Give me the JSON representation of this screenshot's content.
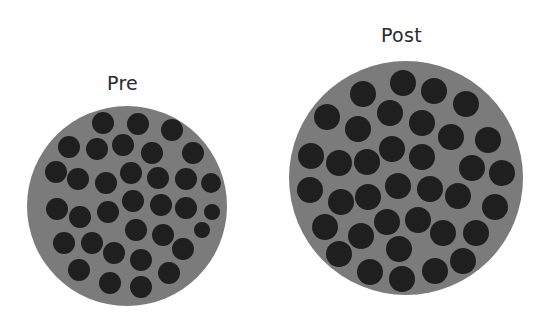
{
  "colors": {
    "disc": "#7b7b7b",
    "dot": "#1f1f1f",
    "background": "#ffffff"
  },
  "panels": [
    {
      "label": "Pre",
      "label_pos": [
        107,
        72
      ],
      "disc": {
        "cx": 127,
        "cy": 206,
        "r": 100
      },
      "dots": [
        [
          103,
          123,
          11
        ],
        [
          138,
          124,
          11
        ],
        [
          172,
          130,
          11
        ],
        [
          69,
          147,
          11
        ],
        [
          97,
          149,
          11
        ],
        [
          123,
          145,
          11
        ],
        [
          152,
          153,
          11
        ],
        [
          193,
          153,
          11
        ],
        [
          56,
          172,
          11
        ],
        [
          78,
          179,
          11
        ],
        [
          106,
          183,
          11
        ],
        [
          131,
          173,
          11
        ],
        [
          158,
          178,
          11
        ],
        [
          186,
          179,
          11
        ],
        [
          211,
          183,
          10
        ],
        [
          57,
          209,
          11
        ],
        [
          80,
          217,
          11
        ],
        [
          108,
          212,
          11
        ],
        [
          133,
          201,
          11
        ],
        [
          161,
          205,
          11
        ],
        [
          186,
          208,
          11
        ],
        [
          212,
          212,
          8
        ],
        [
          136,
          230,
          11
        ],
        [
          163,
          235,
          11
        ],
        [
          202,
          230,
          8
        ],
        [
          64,
          243,
          11
        ],
        [
          92,
          243,
          11
        ],
        [
          114,
          253,
          11
        ],
        [
          141,
          260,
          11
        ],
        [
          183,
          249,
          11
        ],
        [
          79,
          270,
          11
        ],
        [
          110,
          283,
          11
        ],
        [
          141,
          287,
          11
        ],
        [
          169,
          273,
          11
        ]
      ]
    },
    {
      "label": "Post",
      "label_pos": [
        381,
        24
      ],
      "disc": {
        "cx": 406,
        "cy": 178,
        "r": 117
      },
      "dots": [
        [
          363,
          94,
          13
        ],
        [
          403,
          83,
          13
        ],
        [
          434,
          91,
          13
        ],
        [
          466,
          104,
          13
        ],
        [
          327,
          117,
          13
        ],
        [
          390,
          113,
          13
        ],
        [
          358,
          129,
          13
        ],
        [
          422,
          123,
          13
        ],
        [
          451,
          137,
          13
        ],
        [
          488,
          140,
          13
        ],
        [
          311,
          156,
          13
        ],
        [
          339,
          163,
          13
        ],
        [
          367,
          162,
          13
        ],
        [
          392,
          149,
          13
        ],
        [
          422,
          157,
          13
        ],
        [
          472,
          168,
          13
        ],
        [
          502,
          173,
          13
        ],
        [
          310,
          190,
          13
        ],
        [
          341,
          202,
          13
        ],
        [
          368,
          197,
          13
        ],
        [
          398,
          186,
          13
        ],
        [
          430,
          189,
          13
        ],
        [
          458,
          196,
          13
        ],
        [
          495,
          207,
          13
        ],
        [
          325,
          227,
          13
        ],
        [
          387,
          222,
          13
        ],
        [
          418,
          220,
          13
        ],
        [
          361,
          236,
          13
        ],
        [
          443,
          233,
          13
        ],
        [
          476,
          233,
          13
        ],
        [
          339,
          254,
          13
        ],
        [
          399,
          249,
          13
        ],
        [
          370,
          272,
          13
        ],
        [
          402,
          279,
          13
        ],
        [
          435,
          271,
          13
        ],
        [
          463,
          261,
          13
        ]
      ]
    }
  ]
}
